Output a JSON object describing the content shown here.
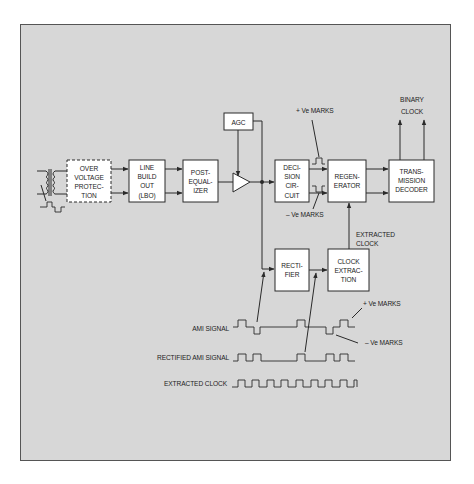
{
  "diagram": {
    "type": "block-diagram",
    "colors": {
      "panel": "#d7d7d7",
      "box": "#ffffff",
      "line": "#2a2a2a"
    }
  },
  "blocks": {
    "over_voltage": [
      "OVER",
      "VOLTAGE",
      "PROTEC-",
      "TION"
    ],
    "line_build_out": [
      "LINE",
      "BUILD",
      "OUT",
      "(LBO)"
    ],
    "post_equalizer": [
      "POST-",
      "EQUAL-",
      "IZER"
    ],
    "agc": "AGC",
    "decision_circuit": [
      "DECI-",
      "SION",
      "CIR-",
      "CUIT"
    ],
    "regenerator": [
      "REGEN-",
      "ERATOR"
    ],
    "transmission_decoder": [
      "TRANS-",
      "MISSION",
      "DECODER"
    ],
    "rectifier": [
      "RECTI-",
      "FIER"
    ],
    "clock_extraction": [
      "CLOCK",
      "EXTRAC-",
      "TION"
    ]
  },
  "labels": {
    "binary": "BINARY",
    "clock": "CLOCK",
    "pos_marks_top": "+ Ve MARKS",
    "neg_marks_top": "– Ve MARKS",
    "extracted": "EXTRACTED",
    "extracted_clock_2": "CLOCK",
    "pos_marks_bottom": "+ Ve MARKS",
    "neg_marks_bottom": "– Ve MARKS"
  },
  "waveforms": {
    "ami": "AMI SIGNAL",
    "rectified": "RECTIFIED AMI SIGNAL",
    "extracted_clock": "EXTRACTED CLOCK"
  }
}
